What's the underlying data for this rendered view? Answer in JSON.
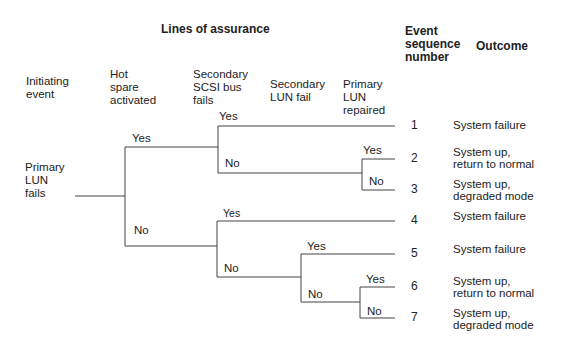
{
  "title": "Lines of assurance",
  "headers": {
    "initiating": "Initiating\nevent",
    "hot_spare": "Hot\nspare\nactivated",
    "scsi": "Secondary\nSCSI bus\nfails",
    "secondary_lun": "Secondary\nLUN fail",
    "primary_repaired": "Primary\nLUN\nrepaired",
    "event_seq": "Event\nsequence\nnumber",
    "outcome": "Outcome"
  },
  "initiating_event": "Primary\nLUN\nfails",
  "branch_labels": {
    "hs_yes": "Yes",
    "hs_no": "No",
    "scsi1_yes": "Yes",
    "scsi1_no": "No",
    "rep1_yes": "Yes",
    "rep1_no": "No",
    "scsi2_yes": "Yes",
    "scsi2_no": "No",
    "slun_yes": "Yes",
    "slun_no": "No",
    "rep2_yes": "Yes",
    "rep2_no": "No"
  },
  "sequences": [
    {
      "number": "1",
      "outcome": "System failure"
    },
    {
      "number": "2",
      "outcome": "System up,\nreturn to normal"
    },
    {
      "number": "3",
      "outcome": "System up,\ndegraded mode"
    },
    {
      "number": "4",
      "outcome": "System failure"
    },
    {
      "number": "5",
      "outcome": "System failure"
    },
    {
      "number": "6",
      "outcome": "System up,\nreturn to normal"
    },
    {
      "number": "7",
      "outcome": "System up,\ndegraded mode"
    }
  ]
}
